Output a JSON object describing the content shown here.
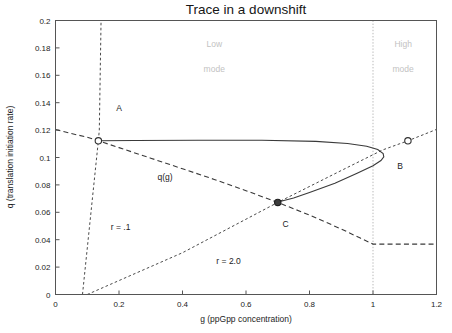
{
  "chart_data": {
    "type": "line",
    "title": "Trace in a downshift",
    "xlabel": "g (ppGpp concentration)",
    "ylabel": "q (translation initiation rate)",
    "xlim": [
      0,
      1.2
    ],
    "ylim": [
      0,
      0.2
    ],
    "xticks": [
      0,
      0.2,
      0.4,
      0.6,
      0.8,
      1,
      1.2
    ],
    "xticklabels": [
      "0",
      "0.2",
      "0.4",
      "0.6",
      "0.8",
      "1",
      "1.2"
    ],
    "yticks": [
      0,
      0.02,
      0.04,
      0.06,
      0.08,
      0.1,
      0.12,
      0.14,
      0.16,
      0.18,
      0.2
    ],
    "yticklabels": [
      "0",
      "0.02",
      "0.04",
      "0.06",
      "0.08",
      "0.1",
      "0.12",
      "0.14",
      "0.16",
      "0.18",
      "0.2"
    ],
    "grid": false,
    "legend": "none",
    "series": [
      {
        "name": "q(g)",
        "style": "dashed",
        "label": "q(g)",
        "points": [
          [
            0.0,
            0.1205
          ],
          [
            0.05,
            0.1175
          ],
          [
            0.1,
            0.1148
          ],
          [
            0.135,
            0.1122
          ],
          [
            0.2,
            0.1072
          ],
          [
            0.3,
            0.0995
          ],
          [
            0.4,
            0.0918
          ],
          [
            0.5,
            0.084
          ],
          [
            0.6,
            0.0758
          ],
          [
            0.7,
            0.0672
          ],
          [
            0.8,
            0.058
          ],
          [
            0.9,
            0.0478
          ],
          [
            0.96,
            0.0412
          ],
          [
            1.0,
            0.0368
          ],
          [
            1.1,
            0.0368
          ],
          [
            1.2,
            0.0368
          ]
        ]
      },
      {
        "name": "r = .1",
        "style": "dotted",
        "label": "r = .1",
        "points": [
          [
            0.085,
            0.0
          ],
          [
            0.135,
            0.1122
          ],
          [
            0.138,
            0.12
          ],
          [
            0.1435,
            0.2
          ]
        ]
      },
      {
        "name": "r = 2.0",
        "style": "dotted",
        "label": "r = 2.0",
        "points": [
          [
            0.1,
            0.0
          ],
          [
            0.4,
            0.0305
          ],
          [
            0.7,
            0.0672
          ],
          [
            0.9,
            0.0905
          ],
          [
            1.03,
            0.1055
          ],
          [
            1.11,
            0.1122
          ],
          [
            1.2,
            0.1205
          ]
        ]
      },
      {
        "name": "trajectory",
        "style": "solid",
        "points": [
          [
            0.135,
            0.1122
          ],
          [
            0.25,
            0.1124
          ],
          [
            0.45,
            0.1126
          ],
          [
            0.65,
            0.1126
          ],
          [
            0.82,
            0.1118
          ],
          [
            0.92,
            0.1102
          ],
          [
            0.98,
            0.1082
          ],
          [
            1.015,
            0.1058
          ],
          [
            1.032,
            0.1028
          ],
          [
            1.034,
            0.1005
          ],
          [
            1.025,
            0.0978
          ],
          [
            1.0,
            0.094
          ],
          [
            0.95,
            0.0885
          ],
          [
            0.88,
            0.0812
          ],
          [
            0.8,
            0.0745
          ],
          [
            0.75,
            0.0705
          ],
          [
            0.71,
            0.068
          ],
          [
            0.7,
            0.0672
          ]
        ]
      }
    ],
    "markers": [
      {
        "name": "A",
        "x": 0.135,
        "y": 0.1122,
        "style": "open"
      },
      {
        "name": "C",
        "x": 0.7,
        "y": 0.0672,
        "style": "filled"
      },
      {
        "name": "B",
        "x": 1.11,
        "y": 0.1122,
        "style": "open"
      }
    ],
    "annotations": [
      {
        "name": "point-label-a",
        "text": "A",
        "x": 0.2,
        "y": 0.136
      },
      {
        "name": "point-label-b",
        "text": "B",
        "x": 1.085,
        "y": 0.0935
      },
      {
        "name": "point-label-c",
        "text": "C",
        "x": 0.725,
        "y": 0.0515
      },
      {
        "name": "curve-label-qg",
        "text": "q(g)",
        "x": 0.345,
        "y": 0.0855
      },
      {
        "name": "curve-label-r-low",
        "text": "r = .1",
        "x": 0.205,
        "y": 0.0495
      },
      {
        "name": "curve-label-r-high",
        "text": "r = 2.0",
        "x": 0.545,
        "y": 0.0245
      },
      {
        "name": "region-label-low",
        "text": "Low",
        "x": 0.5,
        "y": 0.1825
      },
      {
        "name": "region-label-low-mode",
        "text": "mode",
        "x": 0.5,
        "y": 0.1645
      },
      {
        "name": "region-label-high",
        "text": "High",
        "x": 1.095,
        "y": 0.1825
      },
      {
        "name": "region-label-high-mode",
        "text": "mode",
        "x": 1.095,
        "y": 0.1645
      }
    ],
    "divider": {
      "name": "mode-divider",
      "x": 1.0,
      "style": "dotted",
      "color": "#b9b9b9"
    },
    "colors": {
      "axis": "#555555",
      "curve": "#3a3a3a",
      "mode_label": "#c2c2c2",
      "text": "#1c1c1c",
      "background": "#ffffff"
    }
  }
}
